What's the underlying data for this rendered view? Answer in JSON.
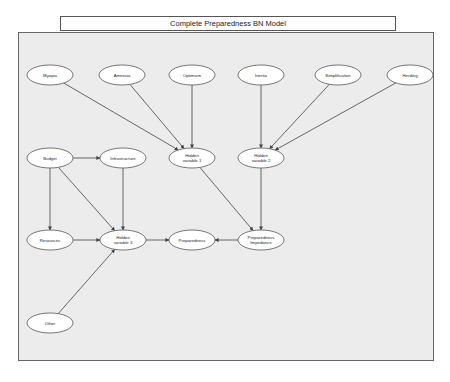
{
  "title": "Complete Preparedness BN Model",
  "nodes": [
    {
      "id": "myopia",
      "label": "Myopia",
      "lines": [
        "Myopia"
      ],
      "x": 50,
      "y": 75
    },
    {
      "id": "amnesia",
      "label": "Amnesia",
      "lines": [
        "Amnesia"
      ],
      "x": 122,
      "y": 75
    },
    {
      "id": "optimism",
      "label": "Optimism",
      "lines": [
        "Optimism"
      ],
      "x": 192,
      "y": 75
    },
    {
      "id": "inertia",
      "label": "Inertia",
      "lines": [
        "Inertia"
      ],
      "x": 261,
      "y": 75
    },
    {
      "id": "simplification",
      "label": "Simplification",
      "lines": [
        "Simplification"
      ],
      "x": 338,
      "y": 75
    },
    {
      "id": "herding",
      "label": "Herding",
      "lines": [
        "Herding"
      ],
      "x": 410,
      "y": 75
    },
    {
      "id": "budget",
      "label": "Budget",
      "lines": [
        "Budget"
      ],
      "x": 50,
      "y": 158
    },
    {
      "id": "infrastructure",
      "label": "Infrastructure",
      "lines": [
        "Infrastructure"
      ],
      "x": 123,
      "y": 158
    },
    {
      "id": "hidden1",
      "label": "Hidden variable 1",
      "lines": [
        "Hidden",
        "variable 1"
      ],
      "x": 192,
      "y": 158
    },
    {
      "id": "hidden2",
      "label": "Hidden variable 2",
      "lines": [
        "Hidden",
        "variable 2"
      ],
      "x": 261,
      "y": 158
    },
    {
      "id": "resources",
      "label": "Resources",
      "lines": [
        "Resources"
      ],
      "x": 50,
      "y": 240
    },
    {
      "id": "hidden3",
      "label": "Hidden variable 3",
      "lines": [
        "Hidden",
        "variable 3"
      ],
      "x": 123,
      "y": 240
    },
    {
      "id": "preparedness",
      "label": "Preparedness",
      "lines": [
        "Preparedness"
      ],
      "x": 192,
      "y": 240
    },
    {
      "id": "impedance",
      "label": "Preparedness Impedance",
      "lines": [
        "Preparedness",
        "Impedance"
      ],
      "x": 261,
      "y": 240
    },
    {
      "id": "other",
      "label": "Other",
      "lines": [
        "Other"
      ],
      "x": 50,
      "y": 323
    }
  ],
  "edges": [
    {
      "from": "myopia",
      "to": "hidden1"
    },
    {
      "from": "amnesia",
      "to": "hidden1"
    },
    {
      "from": "optimism",
      "to": "hidden1"
    },
    {
      "from": "inertia",
      "to": "hidden2"
    },
    {
      "from": "simplification",
      "to": "hidden2"
    },
    {
      "from": "herding",
      "to": "hidden2"
    },
    {
      "from": "budget",
      "to": "infrastructure"
    },
    {
      "from": "budget",
      "to": "resources"
    },
    {
      "from": "budget",
      "to": "hidden3"
    },
    {
      "from": "infrastructure",
      "to": "hidden3"
    },
    {
      "from": "resources",
      "to": "hidden3"
    },
    {
      "from": "other",
      "to": "hidden3"
    },
    {
      "from": "hidden3",
      "to": "preparedness"
    },
    {
      "from": "hidden1",
      "to": "impedance"
    },
    {
      "from": "hidden2",
      "to": "impedance"
    },
    {
      "from": "impedance",
      "to": "preparedness"
    }
  ],
  "style": {
    "node_fill": "#ffffff",
    "node_stroke": "#555555",
    "edge_color": "#444444",
    "panel_bg": "#ececec"
  }
}
